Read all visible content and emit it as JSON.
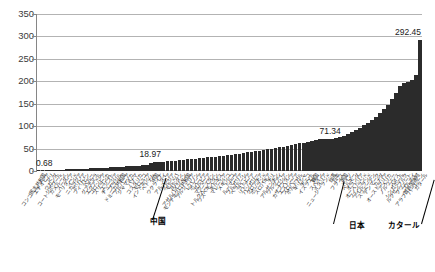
{
  "chart_data": {
    "type": "bar",
    "title": "",
    "xlabel": "",
    "ylabel": "",
    "ylim": [
      0,
      350
    ],
    "ytick_step": 50,
    "yticks": [
      "350",
      "300",
      "250",
      "200",
      "150",
      "100",
      "50",
      "0"
    ],
    "grid": true,
    "legend": "none",
    "bar_color": "#2b2b2b",
    "sorted": "ascending",
    "annotations": [
      {
        "label": "0.68",
        "value": 0.68,
        "position": "first-bar"
      },
      {
        "label": "18.97",
        "value": 18.97,
        "position": "china-bar"
      },
      {
        "label": "71.34",
        "value": 71.34,
        "position": "japan-bar"
      },
      {
        "label": "292.45",
        "value": 292.45,
        "position": "qatar-bar"
      }
    ],
    "callouts": [
      {
        "label": "中国",
        "value": 18.97
      },
      {
        "label": "日本",
        "value": 71.34
      },
      {
        "label": "カタール",
        "value": 292.45
      }
    ],
    "categories": [
      "コンゴ民主共和国",
      "エチオピア",
      "マリ",
      "ウガンダ",
      "コートジボワール",
      "カメルーン",
      "スーダン",
      "モーリタニア",
      "インド",
      "ニカラグア",
      "ボリビア",
      "フィリピン",
      "ペルー",
      "グアテマラ",
      "エクアドル",
      "コロンビア",
      "スリランカ",
      "エジプト",
      "チュニジア",
      "ブラジル",
      "ドミニカ共和国",
      "アルバニア",
      "ジャマイカ",
      "パナマ",
      "コスタリカ",
      "モロッコ",
      "インドネシア",
      "ベトナム",
      "中国",
      "ウクライナ",
      "タイ",
      "アルメニア",
      "グルジア",
      "モルドバ",
      "ヨルダン",
      "アゼルバイジャン",
      "モンテネグロ共和国",
      "アルジェリア",
      "レバノン",
      "ボスニア",
      "セルビア",
      "マケドニア",
      "トルクメニスタン",
      "ウズベキスタン",
      "キルギス",
      "マレーシア",
      "メキシコ",
      "トルコ",
      "ルーマニア",
      "ブルガリア",
      "ベラルーシ",
      "ラトビア",
      "リトアニア",
      "ハンガリー",
      "クロアチア",
      "ポーランド",
      "スロバキア",
      "チリ",
      "アルゼンチン",
      "ウルグアイ",
      "ロシア",
      "カザフスタン",
      "エストニア",
      "スロベニア",
      "ポルトガル",
      "ギリシャ",
      "チェコ",
      "イスラエル",
      "韓国",
      "スペイン",
      "イタリア",
      "ニュージーランド",
      "台湾",
      "日本",
      "フランス",
      "英国",
      "ドイツ",
      "ベルギー",
      "オランダ",
      "オーストリア",
      "フィンランド",
      "アイルランド",
      "スウェーデン",
      "デンマーク",
      "カナダ",
      "オーストラリア",
      "アメリカ",
      "ノルウェー",
      "スイス",
      "シンガポール",
      "ルクセンブルク",
      "クウェート",
      "ブルネイ",
      "アラブ首長国連邦",
      "バーレーン",
      "カタール"
    ],
    "values": [
      0.68,
      1.1,
      1.5,
      1.9,
      2.3,
      2.7,
      3.1,
      3.5,
      3.9,
      4.3,
      4.7,
      5.1,
      5.5,
      5.9,
      6.3,
      6.8,
      7.2,
      7.7,
      8.2,
      8.7,
      9.2,
      9.7,
      10.2,
      10.8,
      11.3,
      11.9,
      12.5,
      13.1,
      18.97,
      19.6,
      20.3,
      21.0,
      21.8,
      22.5,
      23.3,
      24.1,
      24.9,
      25.8,
      26.6,
      27.5,
      28.4,
      29.3,
      30.3,
      31.3,
      32.3,
      33.3,
      34.4,
      35.5,
      36.6,
      37.8,
      39.0,
      40.2,
      41.5,
      42.8,
      44.1,
      45.5,
      46.9,
      48.3,
      49.8,
      51.3,
      52.9,
      54.5,
      56.2,
      57.9,
      59.7,
      61.5,
      63.4,
      65.3,
      67.3,
      69.3,
      70.3,
      70.8,
      71.0,
      71.34,
      73.5,
      76.0,
      79.0,
      82.5,
      86.5,
      91.0,
      96.0,
      101.5,
      107.5,
      114.0,
      121.0,
      129.0,
      138.0,
      148.0,
      160.0,
      174.0,
      190.0,
      196.0,
      199.0,
      203.0,
      214.0,
      292.45
    ]
  },
  "axis": {
    "y_max_label": "350",
    "y_min_label": "0"
  }
}
